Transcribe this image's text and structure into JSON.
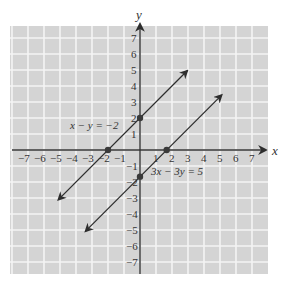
{
  "chart_data": {
    "type": "line",
    "title": "",
    "xlabel": "x",
    "ylabel": "y",
    "xlim": [
      -8,
      8
    ],
    "ylim": [
      -7.5,
      7.7
    ],
    "grid": true,
    "x_ticks": [
      -7,
      -6,
      -5,
      -4,
      -3,
      -2,
      -1,
      1,
      2,
      3,
      4,
      5,
      6,
      7
    ],
    "y_ticks": [
      -7,
      -6,
      -5,
      -4,
      -3,
      -2,
      -1,
      1,
      2,
      3,
      4,
      5,
      6,
      7
    ],
    "x_tick_labels": [
      "−7",
      "−6",
      "−5",
      "−4",
      "−3",
      "−2",
      "−1",
      "1",
      "2",
      "3",
      "4",
      "5",
      "6",
      "7"
    ],
    "y_tick_labels": [
      "−7",
      "−6",
      "−5",
      "−4",
      "−3",
      "−2",
      "−1",
      "1",
      "2",
      "3",
      "4",
      "5",
      "6",
      "7"
    ],
    "series": [
      {
        "name": "x − y = −2",
        "equation": "y = x + 2",
        "x": [
          -5.1,
          2.95
        ],
        "y": [
          -3.1,
          4.95
        ],
        "intercepts": [
          {
            "x": -2,
            "y": 0
          },
          {
            "x": 0,
            "y": 2
          }
        ],
        "label": "x − y = −2",
        "label_pos": [
          -4.3,
          1.3
        ]
      },
      {
        "name": "3x − 3y = 5",
        "equation": "y = x − 5/3",
        "x": [
          -3.4,
          5.1
        ],
        "y": [
          -5.07,
          3.43
        ],
        "intercepts": [
          {
            "x": 1.667,
            "y": 0
          },
          {
            "x": 0,
            "y": -1.667
          }
        ],
        "label": "3x − 3y = 5",
        "label_pos": [
          0.7,
          -1.6
        ]
      }
    ],
    "annotations": [
      "x − y = −2",
      "3x − 3y = 5"
    ]
  },
  "axes": {
    "x_name": "x",
    "y_name": "y"
  },
  "labels": {
    "eq1": "x − y = −2",
    "eq2": "3x − 3y = 5"
  },
  "colors": {
    "grid_bg": "#d4d4d4",
    "grid_line": "#f4f4f4",
    "axis": "#333333",
    "line": "#2e2e2e",
    "point": "#3a3a3a"
  }
}
